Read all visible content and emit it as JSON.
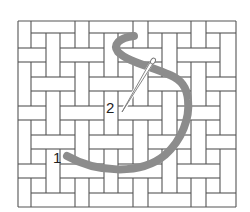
{
  "diagram": {
    "grid": {
      "columns": 15,
      "rows": 13,
      "x_lines": [
        18,
        31,
        46,
        60,
        75,
        89,
        104,
        118,
        133,
        148,
        162,
        177,
        191,
        206,
        220,
        236
      ],
      "y_lines": [
        21,
        33,
        48,
        62,
        77,
        91,
        106,
        120,
        135,
        149,
        164,
        178,
        193,
        207
      ],
      "line_color": "#555555",
      "pattern": "basketweave 3x1 bars with 1x1 squares"
    },
    "stitch": {
      "color": "#8c8c8c",
      "width": 8,
      "path": "M67,156 C95,172 140,176 165,155 C182,140 190,118 188,100 C187,88 182,80 170,75 C150,66 128,62 118,52 C113,45 118,38 134,36"
    },
    "needle": {
      "color": "#777777",
      "from": [
        152,
        62
      ],
      "to": [
        122,
        112
      ]
    },
    "labels": [
      {
        "text": "1",
        "x": 53,
        "y": 163
      },
      {
        "text": "2",
        "x": 106,
        "y": 113
      }
    ]
  }
}
